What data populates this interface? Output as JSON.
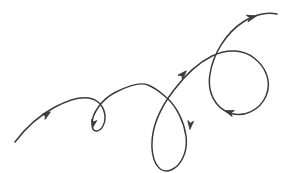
{
  "figure": {
    "background_color": "#ffffff",
    "width": 287,
    "height": 173,
    "stroke_color": "#3a3a3a",
    "stroke_width": 1.5
  },
  "drawing": {
    "type": "freehand-vector-curve",
    "stroke_count": 1,
    "loop_count": 3,
    "arrow_count": 5,
    "start_point": [
      15,
      142
    ],
    "end_point": [
      277,
      14
    ],
    "direction": "lower-left to upper-right",
    "path_d": "M 15,142 C 27,126 40,115 55,107 C 72,98 88,94 98,102 C 105,108 107,118 103,126 C 99,133 92,133 92,124 C 92,113 102,99 116,92 C 130,85 141,82 148,85 C 156,88 160,92 167,98 C 177,107 184,122 186,136 C 188,152 181,166 171,170 C 161,174 153,165 152,148 C 151,128 160,108 174,90 C 186,74 198,63 212,56 C 228,48 244,50 254,58 C 266,67 272,82 266,96 C 260,110 244,118 230,113 C 215,108 207,92 210,74 C 213,54 226,33 243,22 C 255,14 268,12 277,14",
    "segments": [
      {
        "name": "entry-sweep",
        "from": [
          15,
          142
        ],
        "to": [
          98,
          102
        ],
        "shape": "rising arc from lower-left"
      },
      {
        "name": "small-loop",
        "center": [
          99,
          119
        ],
        "rx": 8,
        "ry": 14,
        "shape": "narrow vertical loop"
      },
      {
        "name": "first-hump",
        "from": [
          92,
          124
        ],
        "peak": [
          145,
          84
        ],
        "to": [
          167,
          98
        ],
        "shape": "arching hump"
      },
      {
        "name": "middle-loop",
        "center": [
          173,
          131
        ],
        "rx": 20,
        "ry": 41,
        "shape": "tall vertical loop"
      },
      {
        "name": "ascending-diagonal",
        "from": [
          152,
          148
        ],
        "to": [
          212,
          56
        ],
        "shape": "diagonal rise through crossing"
      },
      {
        "name": "right-loop",
        "center": [
          240,
          85
        ],
        "rx": 35,
        "ry": 32,
        "shape": "large rounded loop"
      },
      {
        "name": "exit-sweep",
        "from": [
          210,
          74
        ],
        "to": [
          277,
          14
        ],
        "shape": "arc exiting to upper-right"
      }
    ],
    "crossings": [
      {
        "name": "small-loop-crossing",
        "at": [
          97,
          104
        ]
      },
      {
        "name": "middle-loop-crossing",
        "at": [
          167,
          93
        ]
      },
      {
        "name": "right-loop-crossing",
        "at": [
          212,
          58
        ]
      }
    ],
    "arrows": [
      {
        "name": "arrow-entry-sweep",
        "at": [
          50,
          112
        ],
        "angle": -36,
        "points": "direction of travel up-right"
      },
      {
        "name": "arrow-small-loop",
        "at": [
          93,
          125
        ],
        "angle": 100,
        "points": "direction of travel downward"
      },
      {
        "name": "arrow-middle-loop",
        "at": [
          190,
          127
        ],
        "angle": 96,
        "points": "direction of travel downward"
      },
      {
        "name": "arrow-ascending-diagonal",
        "at": [
          185,
          72
        ],
        "angle": -47,
        "points": "direction of travel up-right"
      },
      {
        "name": "arrow-right-loop",
        "at": [
          227,
          110
        ],
        "angle": 198,
        "points": "direction of travel down-left"
      },
      {
        "name": "arrow-exit-sweep",
        "at": [
          254,
          17
        ],
        "angle": -18,
        "points": "direction of travel right"
      }
    ]
  }
}
